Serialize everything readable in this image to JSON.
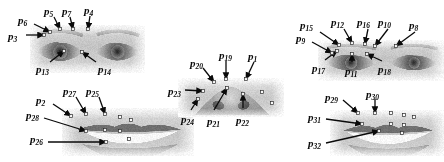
{
  "figure": {
    "background": "#ffffff",
    "ink_color": "#0a0a0a",
    "width": 444,
    "height": 162
  },
  "panels": [
    {
      "name": "left-eye-pair-panel",
      "region": "eyes",
      "subject": "subject-1",
      "x": 30,
      "y": 25,
      "w": 115,
      "h": 48,
      "kind": "eye-pair"
    },
    {
      "name": "left-mouth-panel",
      "region": "mouth",
      "subject": "subject-1",
      "x": 62,
      "y": 108,
      "w": 132,
      "h": 48,
      "kind": "mouth"
    },
    {
      "name": "nose-panel",
      "region": "nose",
      "subject": "subject-1",
      "x": 178,
      "y": 78,
      "w": 106,
      "h": 39,
      "kind": "nose"
    },
    {
      "name": "right-eye-pair-panel",
      "region": "eyes",
      "subject": "subject-2",
      "x": 318,
      "y": 40,
      "w": 126,
      "h": 41,
      "kind": "eye-pair"
    },
    {
      "name": "right-mouth-panel",
      "region": "mouth",
      "subject": "subject-2",
      "x": 330,
      "y": 110,
      "w": 114,
      "h": 46,
      "kind": "mouth"
    }
  ],
  "labels": [
    {
      "id": "p6",
      "base": "p",
      "sub": "6",
      "x": 18,
      "y": 15,
      "group": "left-eye"
    },
    {
      "id": "p5",
      "base": "p",
      "sub": "5",
      "x": 44,
      "y": 6,
      "group": "left-eye"
    },
    {
      "id": "p7",
      "base": "p",
      "sub": "7",
      "x": 62,
      "y": 6,
      "group": "left-eye"
    },
    {
      "id": "p4",
      "base": "p",
      "sub": "4",
      "x": 84,
      "y": 5,
      "group": "left-eye"
    },
    {
      "id": "p3",
      "base": "p",
      "sub": "3",
      "x": 8,
      "y": 31,
      "group": "left-eye"
    },
    {
      "id": "p13",
      "base": "p",
      "sub": "13",
      "x": 36,
      "y": 64,
      "group": "left-eye"
    },
    {
      "id": "p14",
      "base": "p",
      "sub": "14",
      "x": 98,
      "y": 64,
      "group": "left-eye"
    },
    {
      "id": "p2",
      "base": "p",
      "sub": "2",
      "x": 36,
      "y": 95,
      "group": "left-mouth"
    },
    {
      "id": "p27",
      "base": "p",
      "sub": "27",
      "x": 63,
      "y": 86,
      "group": "left-mouth"
    },
    {
      "id": "p25",
      "base": "p",
      "sub": "25",
      "x": 86,
      "y": 86,
      "group": "left-mouth"
    },
    {
      "id": "p28",
      "base": "p",
      "sub": "28",
      "x": 26,
      "y": 110,
      "group": "left-mouth"
    },
    {
      "id": "p26",
      "base": "p",
      "sub": "26",
      "x": 30,
      "y": 134,
      "group": "left-mouth"
    },
    {
      "id": "p20",
      "base": "p",
      "sub": "20",
      "x": 190,
      "y": 58,
      "group": "nose"
    },
    {
      "id": "p19",
      "base": "p",
      "sub": "19",
      "x": 219,
      "y": 50,
      "group": "nose"
    },
    {
      "id": "p1",
      "base": "p",
      "sub": "1",
      "x": 248,
      "y": 51,
      "group": "nose"
    },
    {
      "id": "p23",
      "base": "p",
      "sub": "23",
      "x": 168,
      "y": 86,
      "group": "nose"
    },
    {
      "id": "p24",
      "base": "p",
      "sub": "24",
      "x": 181,
      "y": 114,
      "group": "nose"
    },
    {
      "id": "p21",
      "base": "p",
      "sub": "21",
      "x": 207,
      "y": 116,
      "group": "nose"
    },
    {
      "id": "p22",
      "base": "p",
      "sub": "22",
      "x": 236,
      "y": 115,
      "group": "nose"
    },
    {
      "id": "p15",
      "base": "p",
      "sub": "15",
      "x": 300,
      "y": 20,
      "group": "right-eye"
    },
    {
      "id": "p12",
      "base": "p",
      "sub": "12",
      "x": 331,
      "y": 17,
      "group": "right-eye"
    },
    {
      "id": "p16",
      "base": "p",
      "sub": "16",
      "x": 357,
      "y": 17,
      "group": "right-eye"
    },
    {
      "id": "p10",
      "base": "p",
      "sub": "10",
      "x": 378,
      "y": 17,
      "group": "right-eye"
    },
    {
      "id": "p8",
      "base": "p",
      "sub": "8",
      "x": 409,
      "y": 20,
      "group": "right-eye"
    },
    {
      "id": "p9",
      "base": "p",
      "sub": "9",
      "x": 296,
      "y": 33,
      "group": "right-eye"
    },
    {
      "id": "p17",
      "base": "p",
      "sub": "17",
      "x": 312,
      "y": 63,
      "group": "right-eye"
    },
    {
      "id": "p11",
      "base": "p",
      "sub": "11",
      "x": 345,
      "y": 66,
      "group": "right-eye"
    },
    {
      "id": "p18",
      "base": "p",
      "sub": "18",
      "x": 378,
      "y": 64,
      "group": "right-eye"
    },
    {
      "id": "p29",
      "base": "p",
      "sub": "29",
      "x": 325,
      "y": 92,
      "group": "right-mouth"
    },
    {
      "id": "p30",
      "base": "p",
      "sub": "30",
      "x": 366,
      "y": 89,
      "group": "right-mouth"
    },
    {
      "id": "p31",
      "base": "p",
      "sub": "31",
      "x": 308,
      "y": 112,
      "group": "right-mouth"
    },
    {
      "id": "p32",
      "base": "p",
      "sub": "32",
      "x": 308,
      "y": 138,
      "group": "right-mouth"
    }
  ],
  "arrows": [
    {
      "name": "arrow-p6",
      "x1": 34,
      "y1": 24,
      "x2": 50,
      "y2": 32
    },
    {
      "name": "arrow-p5",
      "x1": 54,
      "y1": 17,
      "x2": 60,
      "y2": 29
    },
    {
      "name": "arrow-p7",
      "x1": 70,
      "y1": 17,
      "x2": 73,
      "y2": 29
    },
    {
      "name": "arrow-p4",
      "x1": 90,
      "y1": 16,
      "x2": 88,
      "y2": 29
    },
    {
      "name": "arrow-p3",
      "x1": 26,
      "y1": 35,
      "x2": 44,
      "y2": 35
    },
    {
      "name": "arrow-p13",
      "x1": 50,
      "y1": 62,
      "x2": 64,
      "y2": 51
    },
    {
      "name": "arrow-p14",
      "x1": 96,
      "y1": 62,
      "x2": 82,
      "y2": 52
    },
    {
      "name": "arrow-p2",
      "x1": 53,
      "y1": 104,
      "x2": 71,
      "y2": 116
    },
    {
      "name": "arrow-p27",
      "x1": 76,
      "y1": 97,
      "x2": 86,
      "y2": 114
    },
    {
      "name": "arrow-p25",
      "x1": 99,
      "y1": 97,
      "x2": 105,
      "y2": 114
    },
    {
      "name": "arrow-p28",
      "x1": 44,
      "y1": 118,
      "x2": 86,
      "y2": 131
    },
    {
      "name": "arrow-p26",
      "x1": 48,
      "y1": 142,
      "x2": 106,
      "y2": 142
    },
    {
      "name": "arrow-p20",
      "x1": 203,
      "y1": 68,
      "x2": 214,
      "y2": 82
    },
    {
      "name": "arrow-p19",
      "x1": 226,
      "y1": 61,
      "x2": 226,
      "y2": 79
    },
    {
      "name": "arrow-p1",
      "x1": 254,
      "y1": 62,
      "x2": 246,
      "y2": 79
    },
    {
      "name": "arrow-p23",
      "x1": 185,
      "y1": 90,
      "x2": 203,
      "y2": 91
    },
    {
      "name": "arrow-p24",
      "x1": 191,
      "y1": 110,
      "x2": 198,
      "y2": 99
    },
    {
      "name": "arrow-p21",
      "x1": 214,
      "y1": 110,
      "x2": 227,
      "y2": 88
    },
    {
      "name": "arrow-p22",
      "x1": 243,
      "y1": 108,
      "x2": 243,
      "y2": 94
    },
    {
      "name": "arrow-p15",
      "x1": 320,
      "y1": 32,
      "x2": 339,
      "y2": 45
    },
    {
      "name": "arrow-p12",
      "x1": 344,
      "y1": 29,
      "x2": 352,
      "y2": 43
    },
    {
      "name": "arrow-p16",
      "x1": 368,
      "y1": 29,
      "x2": 365,
      "y2": 44
    },
    {
      "name": "arrow-p10",
      "x1": 388,
      "y1": 29,
      "x2": 375,
      "y2": 46
    },
    {
      "name": "arrow-p8",
      "x1": 415,
      "y1": 32,
      "x2": 396,
      "y2": 46
    },
    {
      "name": "arrow-p9",
      "x1": 312,
      "y1": 42,
      "x2": 332,
      "y2": 53
    },
    {
      "name": "arrow-p17",
      "x1": 325,
      "y1": 60,
      "x2": 337,
      "y2": 51
    },
    {
      "name": "arrow-p11",
      "x1": 352,
      "y1": 62,
      "x2": 352,
      "y2": 54
    },
    {
      "name": "arrow-p18",
      "x1": 382,
      "y1": 61,
      "x2": 367,
      "y2": 54
    },
    {
      "name": "arrow-p29",
      "x1": 343,
      "y1": 100,
      "x2": 358,
      "y2": 113
    },
    {
      "name": "arrow-p30",
      "x1": 375,
      "y1": 99,
      "x2": 375,
      "y2": 113
    },
    {
      "name": "arrow-p31",
      "x1": 326,
      "y1": 119,
      "x2": 362,
      "y2": 124
    },
    {
      "name": "arrow-p32",
      "x1": 326,
      "y1": 143,
      "x2": 379,
      "y2": 131
    }
  ],
  "landmark_markers": [
    {
      "panel": "left-eye-pair-panel",
      "points": [
        [
          50,
          32
        ],
        [
          60,
          29
        ],
        [
          73,
          29
        ],
        [
          88,
          29
        ],
        [
          64,
          51
        ],
        [
          82,
          52
        ],
        [
          44,
          35
        ]
      ]
    },
    {
      "panel": "left-mouth-panel",
      "points": [
        [
          71,
          116
        ],
        [
          86,
          114
        ],
        [
          105,
          114
        ],
        [
          120,
          117
        ],
        [
          131,
          120
        ],
        [
          86,
          131
        ],
        [
          105,
          130
        ],
        [
          120,
          131
        ],
        [
          106,
          142
        ],
        [
          129,
          139
        ]
      ]
    },
    {
      "panel": "nose-panel",
      "points": [
        [
          214,
          82
        ],
        [
          226,
          79
        ],
        [
          246,
          79
        ],
        [
          203,
          91
        ],
        [
          198,
          99
        ],
        [
          227,
          88
        ],
        [
          243,
          94
        ],
        [
          262,
          92
        ],
        [
          272,
          103
        ]
      ]
    },
    {
      "panel": "right-eye-pair-panel",
      "points": [
        [
          339,
          45
        ],
        [
          352,
          43
        ],
        [
          365,
          44
        ],
        [
          375,
          46
        ],
        [
          396,
          46
        ],
        [
          332,
          53
        ],
        [
          337,
          51
        ],
        [
          352,
          54
        ],
        [
          367,
          54
        ]
      ]
    },
    {
      "panel": "right-mouth-panel",
      "points": [
        [
          358,
          113
        ],
        [
          375,
          113
        ],
        [
          391,
          113
        ],
        [
          404,
          115
        ],
        [
          414,
          117
        ],
        [
          362,
          124
        ],
        [
          391,
          124
        ],
        [
          404,
          125
        ],
        [
          379,
          131
        ],
        [
          402,
          133
        ]
      ]
    }
  ]
}
